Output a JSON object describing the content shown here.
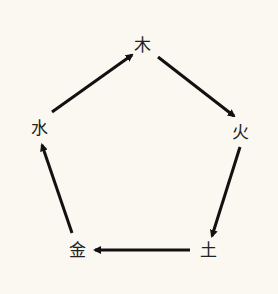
{
  "diagram": {
    "background": "#faf8f0",
    "line_color": "#111111",
    "nodes": [
      {
        "id": "wood",
        "label": "木",
        "x": 142,
        "y": 45
      },
      {
        "id": "fire",
        "label": "火",
        "x": 240,
        "y": 132
      },
      {
        "id": "earth",
        "label": "土",
        "x": 208,
        "y": 250
      },
      {
        "id": "metal",
        "label": "金",
        "x": 77,
        "y": 250
      },
      {
        "id": "water",
        "label": "水",
        "x": 39,
        "y": 128
      }
    ],
    "edges": [
      {
        "from": "wood",
        "to": "fire",
        "x1": 158,
        "y1": 57,
        "x2": 234,
        "y2": 116
      },
      {
        "from": "fire",
        "to": "earth",
        "x1": 240,
        "y1": 147,
        "x2": 212,
        "y2": 236
      },
      {
        "from": "earth",
        "to": "metal",
        "x1": 190,
        "y1": 250,
        "x2": 95,
        "y2": 250
      },
      {
        "from": "metal",
        "to": "water",
        "x1": 72,
        "y1": 233,
        "x2": 42,
        "y2": 145
      },
      {
        "from": "water",
        "to": "wood",
        "x1": 52,
        "y1": 112,
        "x2": 132,
        "y2": 55
      }
    ]
  }
}
